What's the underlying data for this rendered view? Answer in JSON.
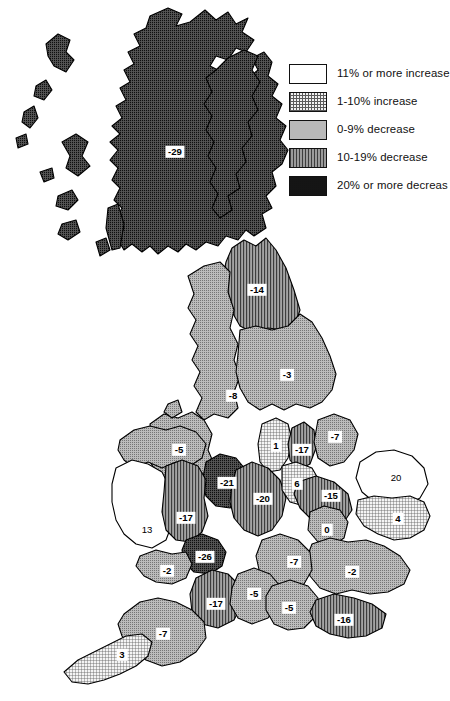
{
  "figure": {
    "kind": "choropleth-map"
  },
  "legend": {
    "title": "",
    "items": [
      {
        "label": "11% or more increase",
        "pattern": "white",
        "swatch_class": "sw-p0"
      },
      {
        "label": "1-10% increase",
        "pattern": "fine-grid",
        "swatch_class": "sw-p1"
      },
      {
        "label": "0-9% decrease",
        "pattern": "light-stipple",
        "swatch_class": "sw-p2"
      },
      {
        "label": "10-19% decrease",
        "pattern": "vertical-lines",
        "swatch_class": "sw-p3"
      },
      {
        "label": "20% or more decreas",
        "pattern": "dark-stipple",
        "swatch_class": "sw-p4"
      }
    ]
  },
  "chart_data": {
    "type": "map",
    "title": "",
    "value_unit": "percent change",
    "categories": [
      "11% or more increase",
      "1-10% increase",
      "0-9% decrease",
      "10-19% decrease",
      "20% or more decrease"
    ],
    "regions": [
      {
        "name": "scotland",
        "value": "-29",
        "class": 4,
        "x": 175,
        "y": 152
      },
      {
        "name": "north-east",
        "value": "-14",
        "class": 3,
        "x": 257,
        "y": 290
      },
      {
        "name": "yorkshire",
        "value": "-3",
        "class": 2,
        "x": 287,
        "y": 375
      },
      {
        "name": "cumbria",
        "value": "-8",
        "class": 2,
        "x": 233,
        "y": 396
      },
      {
        "name": "lancashire",
        "value": "-5",
        "class": 2,
        "x": 179,
        "y": 450
      },
      {
        "name": "greater-mcr",
        "value": "-21",
        "class": 4,
        "x": 227,
        "y": 483
      },
      {
        "name": "merseyside",
        "value": "1",
        "class": 1,
        "x": 276,
        "y": 446
      },
      {
        "name": "humberside",
        "value": "-17",
        "class": 3,
        "x": 302,
        "y": 450
      },
      {
        "name": "lincolnshire",
        "value": "-7",
        "class": 2,
        "x": 335,
        "y": 437
      },
      {
        "name": "west-midlands",
        "value": "-20",
        "class": 3,
        "x": 263,
        "y": 499
      },
      {
        "name": "notts",
        "value": "6",
        "class": 1,
        "x": 297,
        "y": 484
      },
      {
        "name": "leicestershire",
        "value": "-15",
        "class": 3,
        "x": 331,
        "y": 496
      },
      {
        "name": "norfolk",
        "value": "20",
        "class": 0,
        "x": 396,
        "y": 478
      },
      {
        "name": "suffolk",
        "value": "4",
        "class": 1,
        "x": 398,
        "y": 519
      },
      {
        "name": "powys",
        "value": "13",
        "class": 0,
        "x": 147,
        "y": 530
      },
      {
        "name": "mid-wales",
        "value": "-17",
        "class": 3,
        "x": 186,
        "y": 518
      },
      {
        "name": "south-wales",
        "value": "-26",
        "class": 4,
        "x": 205,
        "y": 557
      },
      {
        "name": "swansea",
        "value": "-2",
        "class": 2,
        "x": 167,
        "y": 571
      },
      {
        "name": "cambridgeshire",
        "value": "0",
        "class": 2,
        "x": 327,
        "y": 530
      },
      {
        "name": "essex",
        "value": "-2",
        "class": 2,
        "x": 352,
        "y": 572
      },
      {
        "name": "oxfordshire",
        "value": "-7",
        "class": 2,
        "x": 294,
        "y": 562
      },
      {
        "name": "avon",
        "value": "-17",
        "class": 3,
        "x": 216,
        "y": 604
      },
      {
        "name": "wiltshire",
        "value": "-5",
        "class": 2,
        "x": 254,
        "y": 594
      },
      {
        "name": "hampshire",
        "value": "-5",
        "class": 2,
        "x": 289,
        "y": 608
      },
      {
        "name": "sussex",
        "value": "-16",
        "class": 3,
        "x": 344,
        "y": 620
      },
      {
        "name": "devon",
        "value": "-7",
        "class": 2,
        "x": 163,
        "y": 634
      },
      {
        "name": "cornwall",
        "value": "3",
        "class": 1,
        "x": 122,
        "y": 655
      }
    ]
  }
}
